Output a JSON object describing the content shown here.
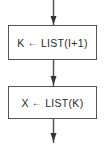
{
  "diagram": {
    "type": "flowchart",
    "direction": "top-to-bottom",
    "colors": {
      "stroke": "#555555",
      "text": "#2a2a2a",
      "background": "#ffffff"
    },
    "nodes": [
      {
        "id": "step1",
        "shape": "process-rectangle",
        "lhs": "K",
        "operator_icon": "left-arrow-assignment",
        "operator_glyph": "←",
        "rhs": "LIST(I+1)",
        "label": "K ← LIST(I+1)"
      },
      {
        "id": "step2",
        "shape": "process-rectangle",
        "lhs": "X",
        "operator_icon": "left-arrow-assignment",
        "operator_glyph": "←",
        "rhs": "LIST(K)",
        "label": "X ← LIST(K)"
      }
    ],
    "edges": [
      {
        "from": "entry",
        "to": "step1"
      },
      {
        "from": "step1",
        "to": "step2"
      },
      {
        "from": "step2",
        "to": "exit"
      }
    ]
  }
}
